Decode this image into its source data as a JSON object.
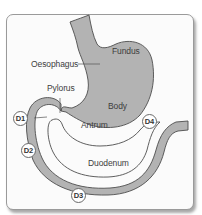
{
  "diagram": {
    "colors": {
      "organ_fill": "#b3b3b3",
      "organ_stroke": "#4d4d4d",
      "background": "#fbfbfb",
      "text": "#3d3d3d"
    },
    "labels": {
      "fundus": "Fundus",
      "oesophagus": "Oesophagus",
      "pylorus": "Pylorus",
      "body": "Body",
      "antrum": "Antrum",
      "duodenum": "Duodenum"
    },
    "markers": {
      "d1": "D1",
      "d2": "D2",
      "d3": "D3",
      "d4": "D4"
    }
  }
}
